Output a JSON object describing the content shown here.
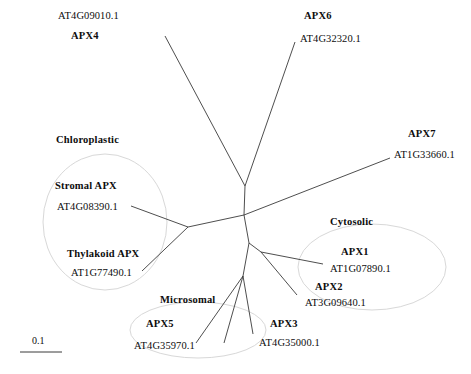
{
  "figure": {
    "type": "unrooted-phylogenetic-tree",
    "scale_bar": {
      "label": "0.1",
      "value": 0.1
    }
  },
  "clades": [
    {
      "name": "Chloroplastic",
      "x": 56,
      "y": 134
    },
    {
      "name": "Cytosolic",
      "x": 330,
      "y": 216
    },
    {
      "name": "Microsomal",
      "x": 160,
      "y": 294
    }
  ],
  "taxa": [
    {
      "gene": "APX4",
      "accession": "AT4G09010.1",
      "acc_x": 58,
      "acc_y": 10,
      "gene_x": 71,
      "gene_y": 30,
      "order": "acc-first"
    },
    {
      "gene": "APX6",
      "accession": "AT4G32320.1",
      "gene_x": 304,
      "gene_y": 10,
      "acc_x": 300,
      "acc_y": 33,
      "order": "gene-first"
    },
    {
      "gene": "APX7",
      "accession": "AT1G33660.1",
      "gene_x": 408,
      "gene_y": 128,
      "acc_x": 394,
      "acc_y": 149,
      "order": "gene-first"
    },
    {
      "gene": "Stromal APX",
      "accession": "AT4G08390.1",
      "gene_x": 55,
      "gene_y": 180,
      "acc_x": 57,
      "acc_y": 201,
      "order": "gene-first"
    },
    {
      "gene": "Thylakoid APX",
      "accession": "AT1G77490.1",
      "gene_x": 67,
      "gene_y": 248,
      "acc_x": 71,
      "acc_y": 267,
      "order": "gene-first"
    },
    {
      "gene": "APX1",
      "accession": "AT1G07890.1",
      "gene_x": 341,
      "gene_y": 246,
      "acc_x": 330,
      "acc_y": 263,
      "order": "gene-first"
    },
    {
      "gene": "APX2",
      "accession": "AT3G09640.1",
      "gene_x": 315,
      "gene_y": 281,
      "acc_x": 305,
      "acc_y": 297,
      "order": "gene-first"
    },
    {
      "gene": "APX3",
      "accession": "AT4G35000.1",
      "gene_x": 270,
      "gene_y": 318,
      "acc_x": 259,
      "acc_y": 337,
      "order": "gene-first"
    },
    {
      "gene": "APX5",
      "accession": "AT4G35970.1",
      "gene_x": 146,
      "gene_y": 318,
      "acc_x": 134,
      "acc_y": 340,
      "order": "gene-first"
    }
  ],
  "branches": [
    {
      "name": "branch-apx4",
      "x1": 245,
      "y1": 186,
      "x2": 165,
      "y2": 36
    },
    {
      "name": "branch-apx6",
      "x1": 245,
      "y1": 186,
      "x2": 295,
      "y2": 42
    },
    {
      "name": "branch-upper-stem",
      "x1": 245,
      "y1": 186,
      "x2": 244,
      "y2": 215
    },
    {
      "name": "branch-apx7",
      "x1": 244,
      "y1": 215,
      "x2": 390,
      "y2": 158
    },
    {
      "name": "branch-to-chloro",
      "x1": 244,
      "y1": 215,
      "x2": 188,
      "y2": 227
    },
    {
      "name": "branch-stromal",
      "x1": 188,
      "y1": 227,
      "x2": 131,
      "y2": 206
    },
    {
      "name": "branch-thylakoid",
      "x1": 188,
      "y1": 227,
      "x2": 142,
      "y2": 271
    },
    {
      "name": "branch-to-cyto-stem",
      "x1": 244,
      "y1": 215,
      "x2": 249,
      "y2": 243
    },
    {
      "name": "branch-cyto-node",
      "x1": 249,
      "y1": 243,
      "x2": 261,
      "y2": 252
    },
    {
      "name": "branch-apx1",
      "x1": 261,
      "y1": 252,
      "x2": 323,
      "y2": 264
    },
    {
      "name": "branch-apx2",
      "x1": 261,
      "y1": 252,
      "x2": 297,
      "y2": 295
    },
    {
      "name": "branch-to-micro-stem",
      "x1": 249,
      "y1": 243,
      "x2": 243,
      "y2": 276
    },
    {
      "name": "branch-apx5",
      "x1": 243,
      "y1": 276,
      "x2": 196,
      "y2": 343
    },
    {
      "name": "branch-apx3",
      "x1": 243,
      "y1": 276,
      "x2": 253,
      "y2": 334
    },
    {
      "name": "branch-micro-left",
      "x1": 243,
      "y1": 276,
      "x2": 224,
      "y2": 343
    }
  ],
  "clade_circles": [
    {
      "name": "chloroplastic-circle",
      "cx": 105,
      "cy": 222,
      "rx": 62,
      "ry": 68,
      "rotate": 0
    },
    {
      "name": "cytosolic-circle",
      "cx": 372,
      "cy": 267,
      "rx": 74,
      "ry": 43,
      "rotate": 0
    },
    {
      "name": "microsomal-circle",
      "cx": 198,
      "cy": 330,
      "rx": 68,
      "ry": 28,
      "rotate": 0
    }
  ],
  "colors": {
    "branch": "#3a3a3a",
    "text": "#0d0d0d",
    "clade_outline": "#d8d8d8",
    "background": "#ffffff"
  }
}
